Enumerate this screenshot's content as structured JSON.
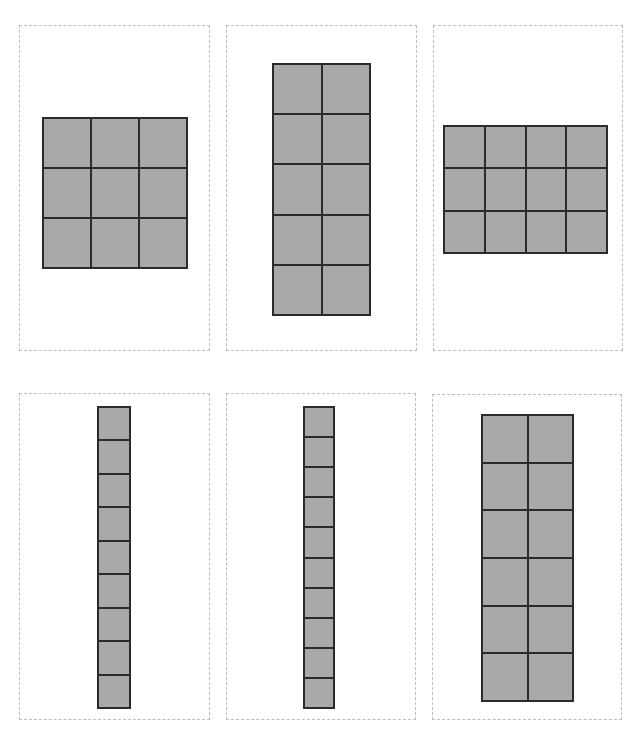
{
  "page": {
    "width": 637,
    "height": 730,
    "background": "#ffffff"
  },
  "colors": {
    "card_border": "#bdbdbd",
    "grid_line": "#2b2b2b",
    "cell_fill": "#a9a9a9"
  },
  "cards": [
    {
      "id": "card-1",
      "box": {
        "x": 19,
        "y": 25,
        "w": 191,
        "h": 326
      },
      "grid": {
        "rows": 3,
        "cols": 3,
        "cell_count": 9,
        "box": {
          "x": 42,
          "y": 117,
          "w": 146,
          "h": 152
        }
      }
    },
    {
      "id": "card-2",
      "box": {
        "x": 226,
        "y": 25,
        "w": 191,
        "h": 326
      },
      "grid": {
        "rows": 5,
        "cols": 2,
        "cell_count": 10,
        "box": {
          "x": 272,
          "y": 63,
          "w": 99,
          "h": 253
        }
      }
    },
    {
      "id": "card-3",
      "box": {
        "x": 433,
        "y": 25,
        "w": 190,
        "h": 326
      },
      "grid": {
        "rows": 3,
        "cols": 4,
        "cell_count": 12,
        "box": {
          "x": 443,
          "y": 125,
          "w": 165,
          "h": 129
        }
      }
    },
    {
      "id": "card-4",
      "box": {
        "x": 19,
        "y": 393,
        "w": 191,
        "h": 327
      },
      "grid": {
        "rows": 9,
        "cols": 1,
        "cell_count": 9,
        "box": {
          "x": 97,
          "y": 406,
          "w": 34,
          "h": 303
        }
      }
    },
    {
      "id": "card-5",
      "box": {
        "x": 226,
        "y": 393,
        "w": 190,
        "h": 327
      },
      "grid": {
        "rows": 10,
        "cols": 1,
        "cell_count": 10,
        "box": {
          "x": 303,
          "y": 406,
          "w": 32,
          "h": 303
        }
      }
    },
    {
      "id": "card-6",
      "box": {
        "x": 432,
        "y": 394,
        "w": 190,
        "h": 326
      },
      "grid": {
        "rows": 6,
        "cols": 2,
        "cell_count": 12,
        "box": {
          "x": 481,
          "y": 414,
          "w": 93,
          "h": 288
        }
      }
    }
  ]
}
